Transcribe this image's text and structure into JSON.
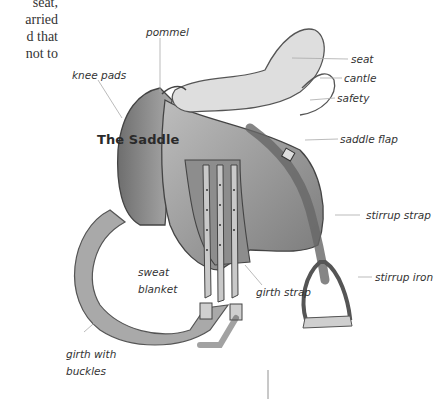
{
  "paragraph": {
    "lines": [
      "seat,",
      "arried",
      "d that",
      "not to"
    ]
  },
  "figure": {
    "title": "The Saddle",
    "labels": {
      "pommel": "pommel",
      "knee_pads": "knee pads",
      "seat": "seat",
      "cantle": "cantle",
      "safety": "safety",
      "saddle_flap": "saddle flap",
      "stirrup_strap": "stirrup strap",
      "stirrup_iron": "stirrup iron",
      "sweat_blanket_1": "sweat",
      "sweat_blanket_2": "blanket",
      "girth_strap": "girth strap",
      "girth_with_buckles_1": "girth with",
      "girth_with_buckles_2": "buckles"
    }
  }
}
